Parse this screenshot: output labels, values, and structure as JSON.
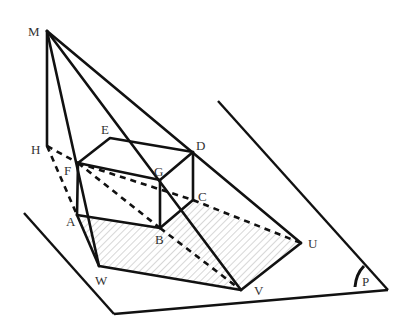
{
  "figure": {
    "background": "#ffffff",
    "stroke_color": "#111111",
    "shadow_fill": "hatched light gray"
  },
  "labels": {
    "M": "M",
    "H": "H",
    "E": "E",
    "D": "D",
    "F": "F",
    "G": "G",
    "C": "C",
    "A": "A",
    "B": "B",
    "W": "W",
    "V": "V",
    "U": "U",
    "P": "P"
  },
  "points": {
    "M": [
      47,
      31
    ],
    "H": [
      47,
      146
    ],
    "E": [
      110,
      138
    ],
    "D": [
      193,
      152
    ],
    "F": [
      78,
      163
    ],
    "G": [
      160,
      180
    ],
    "C": [
      193,
      200
    ],
    "A": [
      77,
      215
    ],
    "B": [
      160,
      228
    ],
    "W": [
      99,
      266
    ],
    "V": [
      241,
      290
    ],
    "U": [
      301,
      243
    ]
  },
  "plane": {
    "label": "P",
    "edges": [
      [
        [
          24,
          213
        ],
        [
          114,
          314
        ]
      ],
      [
        [
          114,
          314
        ],
        [
          388,
          290
        ]
      ],
      [
        [
          218,
          101
        ],
        [
          388,
          290
        ]
      ]
    ]
  }
}
